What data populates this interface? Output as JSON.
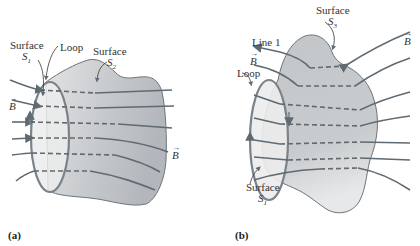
{
  "figure": {
    "colors": {
      "field_line": "#5f6a72",
      "surface_fill_dark": "#b9bcc0",
      "surface_fill_light": "#e6e7e8",
      "loop_fill": "#ececec",
      "outline": "#6c747a",
      "text": "#333333"
    },
    "panel_a": {
      "tag": "(a)",
      "labels": {
        "surface1_word": "Surface",
        "surface1_sym": "S",
        "surface1_sub": "1",
        "loop": "Loop",
        "surface2_word": "Surface",
        "surface2_sym": "S",
        "surface2_sub": "2",
        "b_left": "B",
        "b_right": "B"
      },
      "field_line_count": 7
    },
    "panel_b": {
      "tag": "(b)",
      "labels": {
        "surface3_word": "Surface",
        "surface3_sym": "S",
        "surface3_sub": "3",
        "line1": "Line 1",
        "b_left": "B",
        "b_right": "B",
        "loop": "Loop",
        "surface1_word": "Surface",
        "surface1_sym": "S",
        "surface1_sub": "1"
      },
      "field_line_count": 8
    }
  }
}
